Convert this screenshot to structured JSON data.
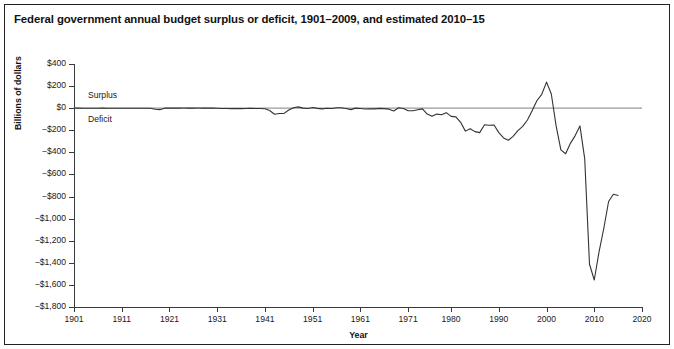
{
  "figure": {
    "title": "Federal government annual budget surplus or deficit, 1901–2009, and estimated 2010–15",
    "border_color": "#222222",
    "background": "#ffffff"
  },
  "annotations": {
    "surplus_label": "Surplus",
    "deficit_label": "Deficit"
  },
  "chart_data": {
    "type": "line",
    "title": "Federal government annual budget surplus or deficit, 1901–2009, and estimated 2010–15",
    "xlabel": "Year",
    "ylabel": "Billions of dollars",
    "xlim": [
      1901,
      2020
    ],
    "ylim": [
      -1800,
      400
    ],
    "grid": false,
    "legend": null,
    "zero_line": true,
    "zero_line_color": "#9a9a9a",
    "line_color": "#333333",
    "xticks": [
      1901,
      1911,
      1921,
      1931,
      1941,
      1951,
      1961,
      1971,
      1980,
      1990,
      2000,
      2010,
      2020
    ],
    "xtick_labels": [
      "1901",
      "1911",
      "1921",
      "1931",
      "1941",
      "1951",
      "1961",
      "1971",
      "1980",
      "1990",
      "2000",
      "2010",
      "2020"
    ],
    "yticks": [
      400,
      200,
      0,
      -200,
      -400,
      -600,
      -800,
      -1000,
      -1200,
      -1400,
      -1600,
      -1800
    ],
    "ytick_labels": [
      "$400",
      "$200",
      "$0",
      "−$200",
      "−$400",
      "−$600",
      "−$800",
      "−$1,000",
      "−$1,200",
      "−$1,400",
      "−$1,600",
      "−$1,800"
    ],
    "annotations": [
      {
        "text": "Surplus",
        "x": 1903,
        "y": 160
      },
      {
        "text": "Deficit",
        "x": 1903,
        "y": -120
      }
    ],
    "series": [
      {
        "name": "Annual budget surplus or deficit",
        "x": [
          1901,
          1902,
          1903,
          1904,
          1905,
          1906,
          1907,
          1908,
          1909,
          1910,
          1911,
          1912,
          1913,
          1914,
          1915,
          1916,
          1917,
          1918,
          1919,
          1920,
          1921,
          1922,
          1923,
          1924,
          1925,
          1926,
          1927,
          1928,
          1929,
          1930,
          1931,
          1932,
          1933,
          1934,
          1935,
          1936,
          1937,
          1938,
          1939,
          1940,
          1941,
          1942,
          1943,
          1944,
          1945,
          1946,
          1947,
          1948,
          1949,
          1950,
          1951,
          1952,
          1953,
          1954,
          1955,
          1956,
          1957,
          1958,
          1959,
          1960,
          1961,
          1962,
          1963,
          1964,
          1965,
          1966,
          1967,
          1968,
          1969,
          1970,
          1971,
          1972,
          1973,
          1974,
          1975,
          1976,
          1977,
          1978,
          1979,
          1980,
          1981,
          1982,
          1983,
          1984,
          1985,
          1986,
          1987,
          1988,
          1989,
          1990,
          1991,
          1992,
          1993,
          1994,
          1995,
          1996,
          1997,
          1998,
          1999,
          2000,
          2001,
          2002,
          2003,
          2004,
          2005,
          2006,
          2007,
          2008,
          2009,
          2010,
          2011,
          2012,
          2013,
          2014,
          2015
        ],
        "values": [
          0.1,
          0.1,
          0.0,
          -0.04,
          -0.02,
          0.03,
          0.09,
          -0.06,
          -0.09,
          -0.02,
          0.01,
          -0.0,
          -0.0,
          -0.0,
          -0.06,
          0.05,
          -0.85,
          -9.03,
          -13.36,
          0.29,
          0.51,
          0.74,
          0.71,
          1.0,
          0.72,
          0.87,
          1.16,
          0.94,
          0.73,
          0.74,
          -0.46,
          -2.74,
          -2.6,
          -3.63,
          -2.8,
          -4.42,
          -2.78,
          -0.09,
          -2.85,
          -2.92,
          -4.94,
          -20.5,
          -54.55,
          -47.56,
          -47.55,
          -15.94,
          4.02,
          11.8,
          0.58,
          -3.12,
          6.1,
          -1.52,
          -6.49,
          -1.15,
          -3.0,
          3.95,
          3.41,
          -2.77,
          -12.85,
          0.3,
          -3.34,
          -7.15,
          -4.76,
          -5.92,
          -1.41,
          -3.7,
          -8.64,
          -25.16,
          3.24,
          -2.84,
          -23.03,
          -23.37,
          -14.91,
          -6.14,
          -53.24,
          -73.73,
          -53.66,
          -59.19,
          -40.73,
          -73.83,
          -79.0,
          -128.0,
          -207.8,
          -185.4,
          -212.3,
          -221.2,
          -149.7,
          -155.2,
          -152.6,
          -221.0,
          -269.2,
          -290.3,
          -255.1,
          -203.2,
          -164.0,
          -107.4,
          -21.9,
          69.3,
          125.6,
          236.2,
          128.2,
          -157.8,
          -377.6,
          -412.7,
          -318.3,
          -248.2,
          -160.7,
          -458.6,
          -1412.7,
          -1555.6,
          -1300.0,
          -1087.0,
          -845.0,
          -779.0,
          -790.0
        ],
        "peak": {
          "year": 2000,
          "value": 236.2,
          "label": "largest surplus"
        },
        "trough": {
          "year": 2010,
          "value": -1555.6,
          "label": "largest deficit"
        }
      }
    ]
  }
}
